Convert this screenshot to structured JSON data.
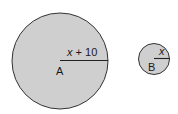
{
  "diagram": {
    "circles": [
      {
        "id": "A",
        "label": "A",
        "radius_label_var": "x",
        "radius_label_rest": " + 10",
        "fill": "#cfcfcf",
        "stroke": "#333333"
      },
      {
        "id": "B",
        "label": "B",
        "radius_label_var": "x",
        "radius_label_rest": "",
        "fill": "#cfcfcf",
        "stroke": "#333333"
      }
    ]
  }
}
